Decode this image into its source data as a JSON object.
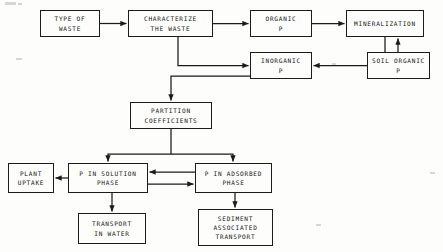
{
  "diagram": {
    "type": "flowchart",
    "colors": {
      "stroke": "#1b1b1b",
      "background": "#fdfdfb",
      "text": "#151515"
    },
    "nodes": [
      {
        "id": "type-of-waste",
        "lines": [
          "TYPE OF",
          "WASTE"
        ],
        "x": 40,
        "y": 10,
        "w": 60,
        "h": 27
      },
      {
        "id": "characterize-waste",
        "lines": [
          "CHARACTERIZE",
          "THE WASTE"
        ],
        "x": 128,
        "y": 10,
        "w": 85,
        "h": 27
      },
      {
        "id": "organic-p",
        "lines": [
          "ORGANIC",
          "P"
        ],
        "x": 250,
        "y": 10,
        "w": 62,
        "h": 27
      },
      {
        "id": "mineralization",
        "lines": [
          "MINERALIZATION"
        ],
        "x": 346,
        "y": 10,
        "w": 78,
        "h": 27
      },
      {
        "id": "inorganic-p",
        "lines": [
          "INORGANIC",
          "P"
        ],
        "x": 250,
        "y": 52,
        "w": 62,
        "h": 27
      },
      {
        "id": "soil-organic-p",
        "lines": [
          "SOIL ORGANIC",
          "P"
        ],
        "x": 367,
        "y": 52,
        "w": 63,
        "h": 27
      },
      {
        "id": "partition-coeff",
        "lines": [
          "PARTITION",
          "COEFFICIENTS"
        ],
        "x": 130,
        "y": 102,
        "w": 82,
        "h": 27
      },
      {
        "id": "plant-uptake",
        "lines": [
          "PLANT",
          "UPTAKE"
        ],
        "x": 8,
        "y": 163,
        "w": 46,
        "h": 30
      },
      {
        "id": "p-in-solution-phase",
        "lines": [
          "P IN SOLUTION",
          "PHASE"
        ],
        "x": 68,
        "y": 163,
        "w": 80,
        "h": 30
      },
      {
        "id": "p-in-adsorbed-phase",
        "lines": [
          "P IN ADSORBED",
          "PHASE"
        ],
        "x": 195,
        "y": 163,
        "w": 77,
        "h": 30
      },
      {
        "id": "transport-in-water",
        "lines": [
          "TRANSPORT",
          "IN WATER"
        ],
        "x": 78,
        "y": 213,
        "w": 68,
        "h": 31
      },
      {
        "id": "sediment-transport",
        "lines": [
          "SEDIMENT",
          "ASSOCIATED",
          "TRANSPORT"
        ],
        "x": 198,
        "y": 209,
        "w": 75,
        "h": 37
      }
    ],
    "edges": [
      {
        "id": "waste-to-characterize",
        "from": "type-of-waste",
        "to": "characterize-waste"
      },
      {
        "id": "characterize-to-organic",
        "from": "characterize-waste",
        "to": "organic-p"
      },
      {
        "id": "characterize-to-inorganic",
        "from": "characterize-waste",
        "to": "inorganic-p"
      },
      {
        "id": "organic-to-mineralization",
        "from": "organic-p",
        "to": "mineralization"
      },
      {
        "id": "mineralization-to-inorganic",
        "from": "mineralization",
        "to": "inorganic-p"
      },
      {
        "id": "soil-organic-to-mineralization",
        "from": "soil-organic-p",
        "to": "mineralization"
      },
      {
        "id": "inorganic-to-partition",
        "from": "inorganic-p",
        "to": "partition-coeff"
      },
      {
        "id": "partition-to-solution",
        "from": "partition-coeff",
        "to": "p-in-solution-phase"
      },
      {
        "id": "partition-to-adsorbed",
        "from": "partition-coeff",
        "to": "p-in-adsorbed-phase"
      },
      {
        "id": "solution-to-plant-uptake",
        "from": "p-in-solution-phase",
        "to": "plant-uptake"
      },
      {
        "id": "adsorbed-to-solution",
        "from": "p-in-adsorbed-phase",
        "to": "p-in-solution-phase"
      },
      {
        "id": "solution-to-adsorbed",
        "from": "p-in-solution-phase",
        "to": "p-in-adsorbed-phase"
      },
      {
        "id": "solution-to-transport-water",
        "from": "p-in-solution-phase",
        "to": "transport-in-water"
      },
      {
        "id": "adsorbed-to-sediment",
        "from": "p-in-adsorbed-phase",
        "to": "sediment-transport"
      }
    ]
  }
}
